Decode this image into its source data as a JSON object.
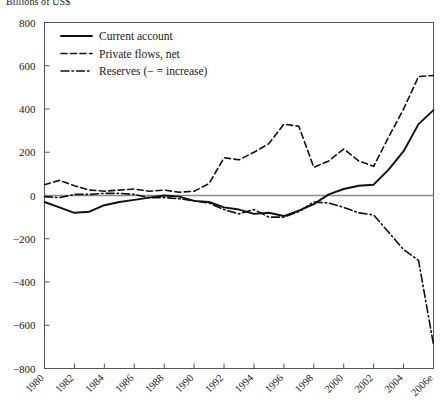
{
  "chart_data": {
    "type": "line",
    "title": "Billions of US$",
    "xlabel": "",
    "ylabel": "",
    "ylim": [
      -800,
      800
    ],
    "yticks": [
      800,
      600,
      400,
      200,
      0,
      -200,
      -400,
      -600,
      -800
    ],
    "ytick_labels": [
      "800",
      "600",
      "400",
      "200",
      "0",
      "−200",
      "−400",
      "−600",
      "−800"
    ],
    "grid": false,
    "zero_line": true,
    "legend_position": "top-left",
    "x": [
      1980,
      1981,
      1982,
      1983,
      1984,
      1985,
      1986,
      1987,
      1988,
      1989,
      1990,
      1991,
      1992,
      1993,
      1994,
      1995,
      1996,
      1997,
      1998,
      1999,
      2000,
      2001,
      2002,
      2003,
      2004,
      2005,
      2006
    ],
    "xtick_values": [
      1980,
      1982,
      1984,
      1986,
      1988,
      1990,
      1992,
      1994,
      1996,
      1998,
      2000,
      2002,
      2004,
      2006
    ],
    "xtick_labels": [
      "1980",
      "1982",
      "1984",
      "1986",
      "1988",
      "1990",
      "1992",
      "1994",
      "1996",
      "1998",
      "2000",
      "2002",
      "2004",
      "2006e"
    ],
    "series": [
      {
        "name": "Current account",
        "style": "solid",
        "values": [
          -30,
          -55,
          -80,
          -75,
          -45,
          -30,
          -20,
          -10,
          0,
          -5,
          -25,
          -30,
          -55,
          -65,
          -85,
          -80,
          -95,
          -70,
          -40,
          5,
          30,
          45,
          50,
          120,
          205,
          330,
          395
        ]
      },
      {
        "name": "Private flows, net",
        "style": "dashed",
        "values": [
          50,
          70,
          45,
          25,
          20,
          25,
          30,
          20,
          25,
          15,
          20,
          55,
          175,
          165,
          200,
          240,
          330,
          320,
          130,
          160,
          215,
          160,
          135,
          270,
          400,
          550,
          555
        ]
      },
      {
        "name": "Reserves (− = increase)",
        "style": "dashdot",
        "values": [
          -5,
          -10,
          5,
          5,
          10,
          10,
          5,
          -10,
          -10,
          -15,
          -25,
          -35,
          -65,
          -85,
          -65,
          -100,
          -100,
          -75,
          -30,
          -35,
          -55,
          -80,
          -90,
          -170,
          -250,
          -300,
          -690
        ]
      }
    ],
    "legend": [
      {
        "label": "Current account",
        "style": "solid"
      },
      {
        "label": "Private flows, net",
        "style": "dashed"
      },
      {
        "label": "Reserves (− = increase)",
        "style": "dashdot"
      }
    ]
  }
}
